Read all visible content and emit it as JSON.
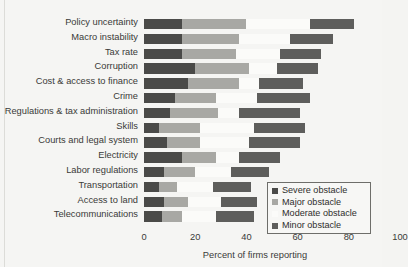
{
  "page": {
    "clipped_header_text": "",
    "background_color": "#f5f5f3"
  },
  "chart_data": {
    "type": "bar",
    "subtype": "horizontal-stacked-bar",
    "title": "",
    "xlabel": "Percent of firms reporting",
    "ylabel": "",
    "xlim": [
      0,
      100
    ],
    "xticks": [
      0,
      20,
      40,
      60,
      80,
      100
    ],
    "xticklabels": [
      "0",
      "20",
      "40",
      "60",
      "80",
      "100"
    ],
    "grid": false,
    "legend_position": "lower-right",
    "categories": [
      "Policy uncertainty",
      "Macro instability",
      "Tax rate",
      "Corruption",
      "Cost & access to finance",
      "Crime",
      "Regulations & tax administration",
      "Skills",
      "Courts and legal system",
      "Electricity",
      "Labor regulations",
      "Transportation",
      "Access to land",
      "Telecommunications"
    ],
    "series": [
      {
        "name": "Severe obstacle",
        "color": "#4a4a48",
        "values": [
          15,
          15,
          15,
          20,
          17,
          12,
          10,
          6,
          9,
          15,
          8,
          6,
          8,
          7
        ]
      },
      {
        "name": "Major obstacle",
        "color": "#a8a8a4",
        "values": [
          25,
          22,
          21,
          21,
          20,
          16,
          19,
          16,
          13,
          13,
          12,
          7,
          9,
          8
        ]
      },
      {
        "name": "Moderate obstacle",
        "color": "#fbfbf9",
        "values": [
          25,
          20,
          17,
          11,
          8,
          16,
          8,
          21,
          19,
          9,
          14,
          14,
          13,
          13
        ]
      },
      {
        "name": "Minor obstacle",
        "color": "#5e5e5c",
        "values": [
          17,
          17,
          16,
          16,
          17,
          21,
          24,
          20,
          20,
          16,
          15,
          15,
          14,
          15
        ]
      }
    ]
  },
  "legend": {
    "items": [
      {
        "label": "Severe obstacle",
        "color": "#4a4a48"
      },
      {
        "label": "Major obstacle",
        "color": "#a8a8a4"
      },
      {
        "label": "Moderate obstacle",
        "color": "#fbfbf9"
      },
      {
        "label": "Minor obstacle",
        "color": "#5e5e5c"
      }
    ]
  }
}
